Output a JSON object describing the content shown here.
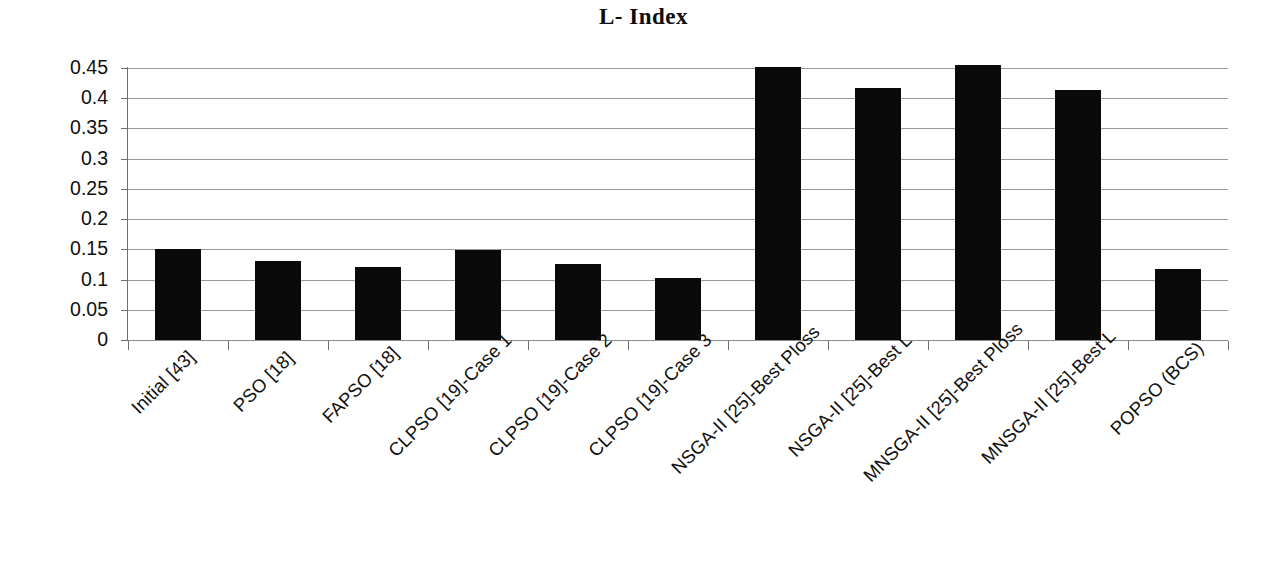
{
  "chart_data": {
    "type": "bar",
    "title": "L- Index",
    "xlabel": "",
    "ylabel": "",
    "ylim": [
      0,
      0.45
    ],
    "grid": true,
    "legend": false,
    "legend_position": "none",
    "bar_color": "#0a0a0a",
    "grid_color": "#9a9a9a",
    "axis_color": "#6f6f6f",
    "yticks": [
      "0.45",
      "0.4",
      "0.35",
      "0.3",
      "0.25",
      "0.2",
      "0.15",
      "0.1",
      "0.05",
      "0"
    ],
    "ytick_values": [
      0.45,
      0.4,
      0.35,
      0.3,
      0.25,
      0.2,
      0.15,
      0.1,
      0.05,
      0
    ],
    "categories": [
      "Initial [43]",
      "PSO [18]",
      "FAPSO [18]",
      "CLPSO [19]-Case 1",
      "CLPSO [19]-Case 2",
      "CLPSO [19]-Case 3",
      "NSGA-II [25]-Best Ploss",
      "NSGA-II [25]-Best L",
      "MNSGA-II [25]-Best Ploss",
      "MNSGA-II [25]-Best L",
      "POPSO (BCS)"
    ],
    "values": [
      0.15,
      0.131,
      0.121,
      0.149,
      0.125,
      0.102,
      0.452,
      0.417,
      0.455,
      0.414,
      0.117
    ]
  }
}
